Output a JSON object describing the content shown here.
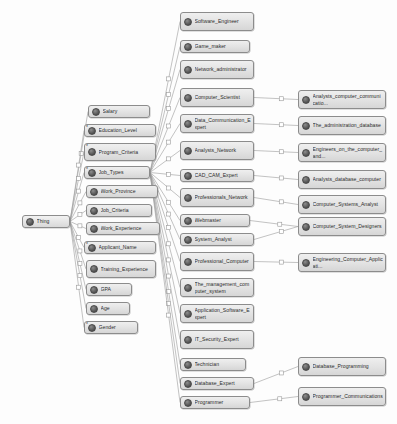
{
  "diagram": {
    "type": "ontology-class-tree",
    "background_color": "#fdfdfd",
    "node_fill_color": "#e2e2e2",
    "node_border_color": "#8c8c8c",
    "edge_color": "#9a9a9a",
    "label_color": "#2b2b2b"
  },
  "root": {
    "id": "thing",
    "label": "Thing",
    "x": 22,
    "y": 215,
    "w": 48,
    "h": 13,
    "marker": ""
  },
  "columns": {
    "level1": [
      {
        "id": "salary",
        "label": "Salary",
        "x": 88,
        "y": 105,
        "w": 62,
        "h": 13,
        "marker": ""
      },
      {
        "id": "education_level",
        "label": "Education_Level",
        "x": 84,
        "y": 124,
        "w": 72,
        "h": 13,
        "marker": "*"
      },
      {
        "id": "program_criteria",
        "label": "Program_Criteria",
        "x": 84,
        "y": 143,
        "w": 72,
        "h": 18,
        "marker": "*"
      },
      {
        "id": "job_types",
        "label": "Job_Types",
        "x": 84,
        "y": 166,
        "w": 66,
        "h": 13,
        "marker": "*"
      },
      {
        "id": "work_province",
        "label": "Work_Province",
        "x": 86,
        "y": 185,
        "w": 72,
        "h": 13,
        "marker": ""
      },
      {
        "id": "job_criteria",
        "label": "Job_Criteria",
        "x": 86,
        "y": 204,
        "w": 66,
        "h": 13,
        "marker": ""
      },
      {
        "id": "work_experience",
        "label": "Work_Experience",
        "x": 86,
        "y": 222,
        "w": 74,
        "h": 13,
        "marker": ""
      },
      {
        "id": "applicant_name",
        "label": "Applicant_Name",
        "x": 84,
        "y": 241,
        "w": 72,
        "h": 13,
        "marker": "*"
      },
      {
        "id": "training_experience",
        "label": "Training_Experience",
        "x": 86,
        "y": 260,
        "w": 70,
        "h": 18,
        "marker": ""
      },
      {
        "id": "gpa",
        "label": "GPA",
        "x": 86,
        "y": 283,
        "w": 46,
        "h": 13,
        "marker": ""
      },
      {
        "id": "age",
        "label": "Age",
        "x": 86,
        "y": 302,
        "w": 44,
        "h": 13,
        "marker": ""
      },
      {
        "id": "gender",
        "label": "Gender",
        "x": 84,
        "y": 321,
        "w": 54,
        "h": 13,
        "marker": "*"
      }
    ],
    "level2": [
      {
        "id": "software_engineer",
        "label": "Software_Engineer",
        "x": 180,
        "y": 12,
        "w": 74,
        "h": 19,
        "marker": ""
      },
      {
        "id": "game_maker",
        "label": "Game_maker",
        "x": 180,
        "y": 40,
        "w": 70,
        "h": 13,
        "marker": ""
      },
      {
        "id": "network_administrator",
        "label": "Network_administrator",
        "x": 180,
        "y": 60,
        "w": 74,
        "h": 19,
        "marker": ""
      },
      {
        "id": "computer_scientist",
        "label": "Computer_Scientist",
        "x": 180,
        "y": 88,
        "w": 74,
        "h": 19,
        "marker": ""
      },
      {
        "id": "data_communication_expert",
        "label": "Data_Communication_Expert",
        "x": 180,
        "y": 114,
        "w": 74,
        "h": 19,
        "marker": ""
      },
      {
        "id": "analysts_network",
        "label": "Analysts_Network",
        "x": 180,
        "y": 141,
        "w": 74,
        "h": 19,
        "marker": ""
      },
      {
        "id": "cad_cam_expert",
        "label": "CAD_CAM_Expert",
        "x": 180,
        "y": 169,
        "w": 74,
        "h": 13,
        "marker": ""
      },
      {
        "id": "professionals_network",
        "label": "Professionals_Network",
        "x": 180,
        "y": 188,
        "w": 74,
        "h": 19,
        "marker": ""
      },
      {
        "id": "webmaster",
        "label": "Webmaster",
        "x": 180,
        "y": 214,
        "w": 70,
        "h": 13,
        "marker": ""
      },
      {
        "id": "system_analyst",
        "label": "System_Analyst",
        "x": 180,
        "y": 233,
        "w": 74,
        "h": 13,
        "marker": ""
      },
      {
        "id": "professional_computer",
        "label": "Professional_Computer",
        "x": 180,
        "y": 252,
        "w": 74,
        "h": 19,
        "marker": ""
      },
      {
        "id": "the_management_computer_system",
        "label": "The_management_computer_system",
        "x": 180,
        "y": 278,
        "w": 74,
        "h": 19,
        "marker": ""
      },
      {
        "id": "application_software_expert",
        "label": "Application_Software_Expert",
        "x": 180,
        "y": 304,
        "w": 74,
        "h": 19,
        "marker": ""
      },
      {
        "id": "it_security_expert",
        "label": "IT_Security_Expert",
        "x": 180,
        "y": 330,
        "w": 74,
        "h": 19,
        "marker": ""
      },
      {
        "id": "technician",
        "label": "Technician",
        "x": 180,
        "y": 358,
        "w": 66,
        "h": 13,
        "marker": ""
      },
      {
        "id": "database_expert",
        "label": "Database_Expert",
        "x": 180,
        "y": 377,
        "w": 74,
        "h": 13,
        "marker": ""
      },
      {
        "id": "programmer",
        "label": "Programmer",
        "x": 180,
        "y": 396,
        "w": 70,
        "h": 13,
        "marker": ""
      }
    ],
    "level3": [
      {
        "id": "analysts_computer_communication",
        "label": "Analysts_computer_communicatio...",
        "x": 298,
        "y": 90,
        "w": 88,
        "h": 19,
        "marker": ""
      },
      {
        "id": "the_administration_database",
        "label": "The_administration_database",
        "x": 298,
        "y": 116,
        "w": 88,
        "h": 19,
        "marker": ""
      },
      {
        "id": "engineers_on_the_computer_and",
        "label": "Engineers_on_the_computer_and...",
        "x": 298,
        "y": 143,
        "w": 88,
        "h": 19,
        "marker": ""
      },
      {
        "id": "analysts_database_computer",
        "label": "Analysts_database_computer",
        "x": 298,
        "y": 170,
        "w": 88,
        "h": 19,
        "marker": ""
      },
      {
        "id": "computer_systems_analyst",
        "label": "Computer_Systems_Analyst",
        "x": 298,
        "y": 195,
        "w": 88,
        "h": 19,
        "marker": ""
      },
      {
        "id": "computer_system_designers",
        "label": "Computer_System_Designers",
        "x": 298,
        "y": 217,
        "w": 88,
        "h": 19,
        "marker": ""
      },
      {
        "id": "engineering_computer_application",
        "label": "Engineering_Computer_Applicati...",
        "x": 298,
        "y": 253,
        "w": 88,
        "h": 19,
        "marker": ""
      },
      {
        "id": "database_programming",
        "label": "Database_Programming",
        "x": 298,
        "y": 357,
        "w": 88,
        "h": 19,
        "marker": ""
      },
      {
        "id": "programmer_communications",
        "label": "Programmer_Communications",
        "x": 298,
        "y": 387,
        "w": 88,
        "h": 19,
        "marker": ""
      }
    ]
  },
  "edges": [
    {
      "from": "thing",
      "to": "salary"
    },
    {
      "from": "thing",
      "to": "education_level"
    },
    {
      "from": "thing",
      "to": "program_criteria"
    },
    {
      "from": "thing",
      "to": "job_types"
    },
    {
      "from": "thing",
      "to": "work_province"
    },
    {
      "from": "thing",
      "to": "job_criteria"
    },
    {
      "from": "thing",
      "to": "work_experience"
    },
    {
      "from": "thing",
      "to": "applicant_name"
    },
    {
      "from": "thing",
      "to": "training_experience"
    },
    {
      "from": "thing",
      "to": "gpa"
    },
    {
      "from": "thing",
      "to": "age"
    },
    {
      "from": "thing",
      "to": "gender"
    },
    {
      "from": "job_types",
      "to": "software_engineer"
    },
    {
      "from": "job_types",
      "to": "game_maker"
    },
    {
      "from": "job_types",
      "to": "network_administrator"
    },
    {
      "from": "job_types",
      "to": "computer_scientist"
    },
    {
      "from": "job_types",
      "to": "data_communication_expert"
    },
    {
      "from": "job_types",
      "to": "analysts_network"
    },
    {
      "from": "job_types",
      "to": "cad_cam_expert"
    },
    {
      "from": "job_types",
      "to": "professionals_network"
    },
    {
      "from": "job_types",
      "to": "webmaster"
    },
    {
      "from": "job_types",
      "to": "system_analyst"
    },
    {
      "from": "job_types",
      "to": "professional_computer"
    },
    {
      "from": "job_types",
      "to": "the_management_computer_system"
    },
    {
      "from": "job_types",
      "to": "application_software_expert"
    },
    {
      "from": "job_types",
      "to": "it_security_expert"
    },
    {
      "from": "job_types",
      "to": "technician"
    },
    {
      "from": "job_types",
      "to": "database_expert"
    },
    {
      "from": "job_types",
      "to": "programmer"
    },
    {
      "from": "computer_scientist",
      "to": "analysts_computer_communication"
    },
    {
      "from": "data_communication_expert",
      "to": "the_administration_database"
    },
    {
      "from": "analysts_network",
      "to": "engineers_on_the_computer_and"
    },
    {
      "from": "cad_cam_expert",
      "to": "analysts_database_computer"
    },
    {
      "from": "professionals_network",
      "to": "computer_systems_analyst"
    },
    {
      "from": "webmaster",
      "to": "computer_system_designers"
    },
    {
      "from": "system_analyst",
      "to": "computer_system_designers"
    },
    {
      "from": "professional_computer",
      "to": "engineering_computer_application"
    },
    {
      "from": "database_expert",
      "to": "database_programming"
    },
    {
      "from": "programmer",
      "to": "programmer_communications"
    }
  ]
}
